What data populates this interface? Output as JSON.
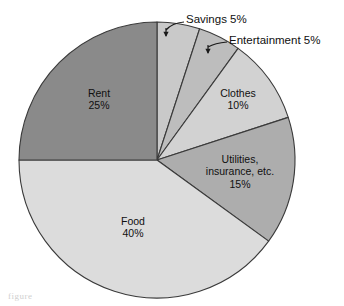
{
  "chart_data": {
    "type": "pie",
    "title": "",
    "subtitle": "",
    "xlabel": "",
    "ylabel": "",
    "legend_position": "none",
    "grid": false,
    "start_angle_deg": 0,
    "direction": "clockwise",
    "categories": [
      "Savings",
      "Entertainment",
      "Clothes",
      "Utilities, insurance, etc.",
      "Food",
      "Rent"
    ],
    "values": [
      5,
      10,
      10,
      15,
      40,
      25
    ],
    "units": "percent",
    "slices": [
      {
        "name": "Savings",
        "label_line1": "Savings 5%",
        "value": 5,
        "value_label": "5%",
        "color": "#c9c9c9",
        "label_style": "callout",
        "label_x": 186,
        "label_y": 20,
        "arrow_tip_x": 166,
        "arrow_tip_y": 37,
        "leader_from_x": 184,
        "leader_from_y": 22,
        "leader_ctrl_x": 172,
        "leader_ctrl_y": 23
      },
      {
        "name": "Entertainment",
        "label_line1": "Entertainment 5%",
        "value": 5,
        "value_label": "5%",
        "color": "#bdbdbd",
        "label_style": "callout",
        "label_x": 229,
        "label_y": 41,
        "arrow_tip_x": 208,
        "arrow_tip_y": 54,
        "leader_from_x": 227,
        "leader_from_y": 42,
        "leader_ctrl_x": 215,
        "leader_ctrl_y": 43
      },
      {
        "name": "Clothes",
        "label_line1": "Clothes",
        "label_line2": "10%",
        "value": 10,
        "value_label": "10%",
        "color": "#d2d2d2",
        "label_style": "inner",
        "label_x": 238,
        "label_y": 100
      },
      {
        "name": "Utilities, insurance, etc.",
        "label_line1": "Utilities,",
        "label_line2": "insurance, etc.",
        "label_line3": "15%",
        "value": 15,
        "value_label": "15%",
        "color": "#adadad",
        "label_style": "inner",
        "label_x": 240,
        "label_y": 172
      },
      {
        "name": "Food",
        "label_line1": "Food",
        "label_line2": "40%",
        "value": 40,
        "value_label": "40%",
        "color": "#dcdcdc",
        "label_style": "inner",
        "label_x": 133,
        "label_y": 228
      },
      {
        "name": "Rent",
        "label_line1": "Rent",
        "label_line2": "25%",
        "value": 25,
        "value_label": "25%",
        "color": "#8a8a8a",
        "label_style": "inner",
        "label_x": 99,
        "label_y": 100
      }
    ],
    "geometry": {
      "center_x": 157,
      "center_y": 160,
      "radius": 138
    },
    "palette": {
      "outline": "#3a3a3a",
      "text": "#101010",
      "background": "#ffffff"
    }
  },
  "caption": {
    "ghost_text": "figure"
  }
}
